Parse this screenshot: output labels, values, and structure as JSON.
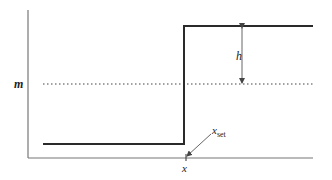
{
  "diagram": {
    "type": "step-function",
    "labels": {
      "mean": "m",
      "height": "h",
      "x_axis": "x",
      "x_set_main": "x",
      "x_set_sub": "set"
    },
    "colors": {
      "axes": "#666666",
      "step_line": "#2a2a2a",
      "dotted_line": "#444444",
      "arrow": "#555555"
    }
  }
}
